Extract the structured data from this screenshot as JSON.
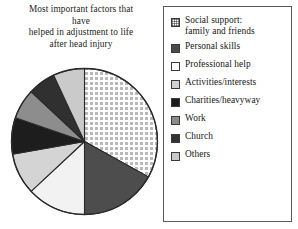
{
  "title": {
    "lines": [
      "Most important factors that",
      "have",
      "helped in adjustment to life",
      "after head injury"
    ]
  },
  "legend": {
    "items": [
      {
        "label": "Social support:",
        "label2": "family and friends",
        "swatch": "dotted-light",
        "color": "#e8e8e8"
      },
      {
        "label": "Personal skills",
        "label2": "",
        "swatch": "solid-dark-gray",
        "color": "#4a4a4a"
      },
      {
        "label": "Professional help",
        "label2": "",
        "swatch": "solid-white",
        "color": "#fdfdfd"
      },
      {
        "label": "Activities/interests",
        "label2": "",
        "swatch": "solid-light-gray",
        "color": "#d2d2d2"
      },
      {
        "label": "Charities/heavyway",
        "label2": "",
        "swatch": "solid-black",
        "color": "#1b1b1b"
      },
      {
        "label": "Work",
        "label2": "",
        "swatch": "solid-medium-gray",
        "color": "#8a8a8a"
      },
      {
        "label": "Church",
        "label2": "",
        "swatch": "solid-very-dark",
        "color": "#333333"
      },
      {
        "label": "Others",
        "label2": "",
        "swatch": "solid-pale-gray",
        "color": "#c8c8c8"
      }
    ]
  },
  "chart_data": {
    "type": "pie",
    "title": "Most important factors that have helped in adjustment to life after head injury",
    "start_angle": 0,
    "direction": "clockwise",
    "center": [
      74.5,
      74.5
    ],
    "radius": 73,
    "legend_position": "right",
    "categories": [
      "Social support: family and friends",
      "Personal skills",
      "Professional help",
      "Activities/interests",
      "Charities/heavyway",
      "Work",
      "Church",
      "Others"
    ],
    "values": [
      33,
      17,
      13,
      9,
      8,
      7,
      6,
      7
    ],
    "units": "percent",
    "slices": [
      {
        "name": "Social support: family and friends",
        "value": 33,
        "start_deg": 0,
        "end_deg": 119,
        "fill": "dotted-light",
        "color": "#e9e9e9"
      },
      {
        "name": "Personal skills",
        "value": 17,
        "start_deg": 119,
        "end_deg": 180,
        "fill": "solid-dark-gray",
        "color": "#4d4d4d"
      },
      {
        "name": "Professional help",
        "value": 13,
        "start_deg": 180,
        "end_deg": 227,
        "fill": "solid-white",
        "color": "#f2f2f2"
      },
      {
        "name": "Activities/interests",
        "value": 9,
        "start_deg": 227,
        "end_deg": 260,
        "fill": "solid-light-gray",
        "color": "#d4d4d4"
      },
      {
        "name": "Charities/heavyway",
        "value": 8,
        "start_deg": 260,
        "end_deg": 289,
        "fill": "solid-black",
        "color": "#1d1d1d"
      },
      {
        "name": "Work",
        "value": 7,
        "start_deg": 289,
        "end_deg": 313,
        "fill": "solid-medium-gray",
        "color": "#8d8d8d"
      },
      {
        "name": "Church",
        "value": 6,
        "start_deg": 313,
        "end_deg": 335,
        "fill": "solid-very-dark",
        "color": "#303030"
      },
      {
        "name": "Others",
        "value": 7,
        "start_deg": 335,
        "end_deg": 360,
        "fill": "solid-pale-gray",
        "color": "#cacaca"
      }
    ]
  }
}
